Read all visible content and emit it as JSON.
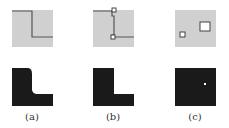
{
  "panels": [
    {
      "id": "a",
      "caption": "(a)",
      "top": "gray square with L-shaped dark boundary line",
      "bottom": "black L shape with rounded inner corner"
    },
    {
      "id": "b",
      "caption": "(b)",
      "top": "gray square with L-shaped boundary and small square markers at corners",
      "bottom": "black L shape with sharp corners"
    },
    {
      "id": "c",
      "caption": "(c)",
      "top": "gray square with two small outlined squares",
      "bottom": "black square with single white dot"
    }
  ],
  "colors": {
    "light": "#cfcfcf",
    "dark": "#1a1a1a",
    "line": "#555555"
  }
}
